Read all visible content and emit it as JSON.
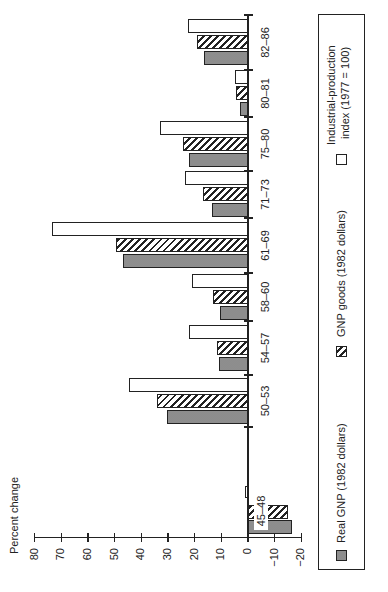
{
  "chart_data": {
    "type": "bar",
    "orientation": "horizontal bars (figure printed rotated 90° counter-clockwise; value axis along page bottom-left)",
    "title": "",
    "ylabel": "Percent change",
    "xlabel": "",
    "ylim": [
      -20,
      80
    ],
    "yticks": [
      80,
      70,
      60,
      50,
      40,
      30,
      20,
      10,
      0,
      -10,
      -20
    ],
    "ytick_labels": [
      "80",
      "70",
      "60",
      "50",
      "40",
      "30",
      "20",
      "10",
      "0",
      "−10",
      "−20"
    ],
    "grid": false,
    "legend_position": "bottom (boxed)",
    "categories": [
      "45–48",
      "50–53",
      "54–57",
      "58–60",
      "61–69",
      "71–73",
      "75–80",
      "80–81",
      "82–86"
    ],
    "series": [
      {
        "name": "Real GNP (1982 dollars)",
        "pattern": "gray-stipple",
        "color": "#9c9c9c",
        "values": [
          -16.5,
          30.5,
          11,
          10.5,
          47,
          13.5,
          22,
          3,
          16.5
        ]
      },
      {
        "name": "GNP goods (1982 dollars)",
        "pattern": "diagonal-hatch",
        "color": "#222222",
        "values": [
          -15,
          34,
          11.5,
          13,
          49.5,
          17,
          24.5,
          4.5,
          19
        ]
      },
      {
        "name": "Industrial-production index (1977 = 100)",
        "pattern": "white",
        "color": "#ffffff",
        "values": [
          1,
          44.5,
          22,
          21,
          73.5,
          23.5,
          33,
          5,
          22.5
        ]
      }
    ]
  },
  "legend": {
    "items": [
      {
        "label": "Real GNP (1982 dollars)",
        "swatch": "gray"
      },
      {
        "label": "GNP goods (1982 dollars)",
        "swatch": "hatch"
      },
      {
        "label_line1": "Industrial-production",
        "label_line2": "index (1977 = 100)",
        "swatch": "white"
      }
    ]
  }
}
